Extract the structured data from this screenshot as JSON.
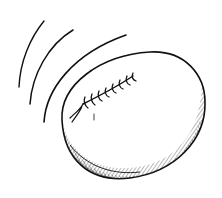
{
  "illustration": {
    "subject": "football-in-motion",
    "style": "pen-and-ink",
    "colors": {
      "background": "#ffffff",
      "ink": "#111111"
    },
    "motion_lines": 3,
    "lace_stitches": 8
  }
}
